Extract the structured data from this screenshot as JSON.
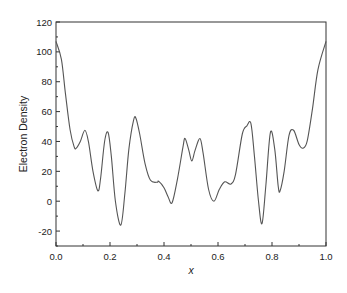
{
  "chart_data": {
    "type": "line",
    "title": "",
    "xlabel": "x",
    "ylabel": "Electron Density",
    "xlim": [
      0.0,
      1.0
    ],
    "ylim": [
      -30,
      120
    ],
    "xticks": [
      0.0,
      0.2,
      0.4,
      0.6,
      0.8,
      1.0
    ],
    "xtick_labels": [
      "0.0",
      "0.2",
      "0.4",
      "0.6",
      "0.8",
      "1.0"
    ],
    "yticks": [
      -20,
      0,
      20,
      40,
      60,
      80,
      100,
      120
    ],
    "ytick_labels": [
      "-20",
      "0",
      "20",
      "40",
      "60",
      "80",
      "100",
      "120"
    ],
    "grid": false,
    "legend": null,
    "line_color": "#555555",
    "series": [
      {
        "name": "Electron Density",
        "x": [
          0.0,
          0.02,
          0.035,
          0.052,
          0.067,
          0.075,
          0.09,
          0.107,
          0.12,
          0.137,
          0.155,
          0.165,
          0.18,
          0.193,
          0.205,
          0.22,
          0.24,
          0.255,
          0.27,
          0.287,
          0.296,
          0.31,
          0.33,
          0.35,
          0.375,
          0.38,
          0.4,
          0.415,
          0.43,
          0.45,
          0.47,
          0.478,
          0.492,
          0.503,
          0.515,
          0.533,
          0.545,
          0.565,
          0.585,
          0.605,
          0.625,
          0.648,
          0.665,
          0.69,
          0.707,
          0.722,
          0.735,
          0.75,
          0.763,
          0.777,
          0.794,
          0.81,
          0.823,
          0.83,
          0.845,
          0.863,
          0.88,
          0.9,
          0.915,
          0.93,
          0.95,
          0.97,
          1.0
        ],
        "y": [
          107,
          95,
          72,
          48,
          36.5,
          35.5,
          40,
          47.5,
          40,
          20,
          7,
          15,
          40,
          46,
          30,
          0,
          -16,
          5,
          35,
          54,
          55.6,
          45,
          25,
          14,
          12.7,
          13.4,
          9,
          3,
          -1,
          15,
          36,
          42,
          34,
          27,
          34,
          42,
          32,
          8,
          0,
          8,
          13,
          11.5,
          18,
          45,
          50.5,
          52,
          30,
          0,
          -15,
          10,
          46,
          35,
          10,
          7,
          20,
          44,
          47.5,
          38,
          35.5,
          40,
          62,
          88,
          107
        ]
      }
    ]
  }
}
